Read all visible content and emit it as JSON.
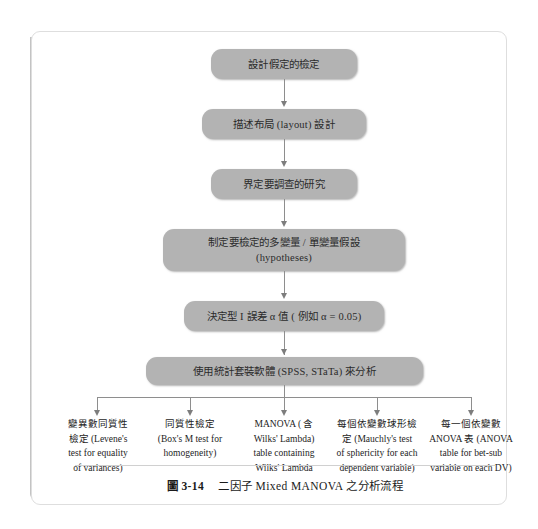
{
  "figure": {
    "caption_label": "圖 3-14",
    "caption_title": "二因子 Mixed MANOVA 之分析流程"
  },
  "flow": {
    "steps": [
      {
        "id": "step-1",
        "text": "設計假定的檢定"
      },
      {
        "id": "step-2",
        "text": "描述布局 (layout) 設計"
      },
      {
        "id": "step-3",
        "text": "界定要調查的研究"
      },
      {
        "id": "step-4",
        "line1": "制定要檢定的多變量 / 單變量假設",
        "line2": "(hypotheses)"
      },
      {
        "id": "step-5",
        "text": "決定型 I 誤差 α 值 ( 例如 α = 0.05)"
      },
      {
        "id": "step-6",
        "text": "使用統計套裝軟體 (SPSS, STaTa) 來分析"
      }
    ]
  },
  "outputs": [
    {
      "id": "leaf-levene",
      "lines": [
        "變異數同質性",
        "檢定 (Levene's",
        "test for equality",
        "of variances)"
      ]
    },
    {
      "id": "leaf-boxm",
      "lines": [
        "同質性檢定",
        "(Box's M test for",
        "homogeneity)"
      ]
    },
    {
      "id": "leaf-manova",
      "lines": [
        "MANOVA ( 含",
        "Wilks' Lambda)",
        "table containing",
        "Wilks' Lambda"
      ]
    },
    {
      "id": "leaf-mauchly",
      "lines": [
        "每個依變數球形檢",
        "定 (Mauchly's test",
        "of sphericity for each",
        "dependent variable)"
      ]
    },
    {
      "id": "leaf-anova",
      "lines": [
        "每一個依變數",
        "ANOVA 表 (ANOVA",
        "table for bet-sub",
        "variable on each DV)"
      ]
    }
  ],
  "colors": {
    "box_fill": "#b3b3b3",
    "connector": "#8e8e8e",
    "spine": "#b4b4b4",
    "frame_border": "#dedede",
    "page_background": "#ffffff"
  }
}
